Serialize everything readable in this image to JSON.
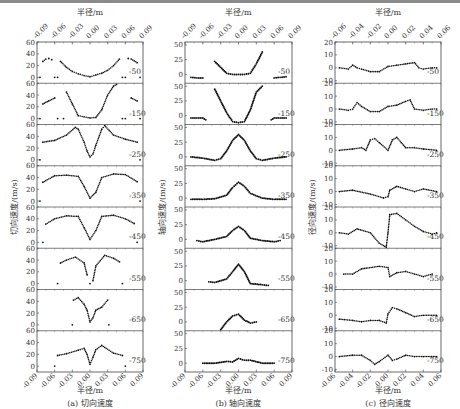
{
  "figure": {
    "x_axis_label": "半径/m",
    "levels": [
      "-50",
      "-150",
      "-250",
      "-350",
      "-450",
      "-550",
      "-650",
      "-750"
    ]
  },
  "panels": [
    {
      "id": "a",
      "caption": "(a)  切向速度",
      "ylabel": "切向速度/(m/s)",
      "xticks": [
        "-0.09",
        "-0.06",
        "-0.03",
        "0.00",
        "0.03",
        "0.06",
        "0.09"
      ],
      "yticks": [
        "0",
        "20",
        "40",
        "60"
      ]
    },
    {
      "id": "b",
      "caption": "(b)  轴向速度",
      "ylabel": "轴向速度/(m/s)",
      "xticks": [
        "-0.09",
        "-0.06",
        "-0.03",
        "0.00",
        "0.03",
        "0.06",
        "0.09"
      ],
      "yticks": [
        "0",
        "25",
        "50"
      ]
    },
    {
      "id": "c",
      "caption": "(c)  径向速度",
      "ylabel": "径向速度/(m/s)",
      "xticks": [
        "-0.06",
        "-0.04",
        "-0.02",
        "0.00",
        "0.02",
        "0.04",
        "0.06"
      ],
      "yticks": [
        "-10",
        "0",
        "10",
        "20"
      ]
    }
  ],
  "chart_data": [
    {
      "type": "scatter",
      "title": "(a) 切向速度",
      "xlabel": "半径/m",
      "ylabel": "切向速度/(m/s)",
      "xlim": [
        -0.09,
        0.09
      ],
      "ylim": [
        -10,
        60
      ],
      "xticks": [
        -0.09,
        -0.06,
        -0.03,
        0.0,
        0.03,
        0.06,
        0.09
      ],
      "yticks": [
        0,
        20,
        40,
        60
      ],
      "series": [
        {
          "name": "-50",
          "x": [
            -0.085,
            -0.08,
            -0.075,
            -0.07,
            -0.065,
            -0.06,
            -0.055,
            -0.05,
            -0.04,
            -0.03,
            -0.02,
            -0.01,
            0,
            0.01,
            0.02,
            0.03,
            0.04,
            0.05,
            0.055,
            0.06,
            0.065,
            0.07,
            0.075,
            0.08,
            0.085
          ],
          "y": [
            0,
            27,
            31,
            32,
            30,
            0,
            0,
            27,
            17,
            10,
            6,
            3,
            1,
            4,
            7,
            12,
            20,
            31,
            0,
            0,
            32,
            31,
            28,
            25,
            0
          ]
        },
        {
          "name": "-150",
          "x": [
            -0.085,
            -0.08,
            -0.07,
            -0.06,
            -0.055,
            -0.045,
            -0.04,
            -0.03,
            -0.02,
            -0.01,
            0,
            0.01,
            0.02,
            0.03,
            0.04,
            0.045,
            0.055,
            0.06,
            0.07,
            0.08,
            0.085
          ],
          "y": [
            0,
            25,
            30,
            35,
            0,
            0,
            45,
            25,
            5,
            3,
            1,
            2,
            15,
            40,
            55,
            58,
            0,
            0,
            35,
            30,
            0
          ],
          "note": "approximate"
        },
        {
          "name": "-250",
          "x": [
            -0.085,
            -0.08,
            -0.06,
            -0.04,
            -0.025,
            -0.02,
            -0.01,
            -0.005,
            0,
            0.005,
            0.01,
            0.02,
            0.025,
            0.04,
            0.06,
            0.08,
            0.085
          ],
          "y": [
            0,
            30,
            33,
            42,
            55,
            52,
            30,
            15,
            5,
            10,
            25,
            52,
            58,
            42,
            35,
            30,
            0
          ]
        },
        {
          "name": "-350",
          "x": [
            -0.085,
            -0.08,
            -0.06,
            -0.04,
            -0.02,
            -0.01,
            0,
            0.01,
            0.02,
            0.04,
            0.06,
            0.08,
            0.085
          ],
          "y": [
            0,
            32,
            43,
            44,
            42,
            25,
            5,
            15,
            40,
            46,
            45,
            33,
            0
          ]
        },
        {
          "name": "-450",
          "x": [
            -0.08,
            -0.075,
            -0.06,
            -0.04,
            -0.02,
            -0.01,
            0,
            0.01,
            0.02,
            0.04,
            0.06,
            0.075,
            0.08
          ],
          "y": [
            0,
            31,
            40,
            45,
            44,
            25,
            5,
            20,
            44,
            46,
            40,
            32,
            0
          ]
        },
        {
          "name": "-550",
          "x": [
            -0.055,
            -0.05,
            -0.04,
            -0.025,
            -0.01,
            -0.005,
            0,
            0.005,
            0.01,
            0.025,
            0.04,
            0.05,
            0.055
          ],
          "y": [
            0,
            35,
            40,
            45,
            35,
            15,
            0,
            5,
            30,
            48,
            43,
            37,
            0
          ]
        },
        {
          "name": "-650",
          "x": [
            -0.03,
            -0.028,
            -0.02,
            -0.01,
            -0.005,
            0,
            0.005,
            0.01,
            0.02,
            0.03,
            0.032
          ],
          "y": [
            0,
            42,
            46,
            35,
            25,
            5,
            12,
            25,
            30,
            42,
            0
          ]
        },
        {
          "name": "-750",
          "x": [
            -0.06,
            -0.055,
            -0.04,
            -0.02,
            -0.01,
            -0.005,
            0,
            0.005,
            0.01,
            0.02,
            0.04,
            0.055,
            0.06
          ],
          "y": [
            0,
            18,
            21,
            27,
            30,
            20,
            3,
            15,
            28,
            35,
            22,
            18,
            0
          ]
        }
      ]
    },
    {
      "type": "line",
      "title": "(b) 轴向速度",
      "xlabel": "半径/m",
      "ylabel": "轴向速度/(m/s)",
      "xlim": [
        -0.09,
        0.09
      ],
      "ylim": [
        -15,
        55
      ],
      "xticks": [
        -0.09,
        -0.06,
        -0.03,
        0.0,
        0.03,
        0.06,
        0.09
      ],
      "yticks": [
        0,
        25,
        50
      ],
      "series": [
        {
          "name": "-50",
          "x": [
            -0.08,
            -0.07,
            -0.06,
            -0.045,
            -0.04,
            -0.03,
            -0.02,
            -0.01,
            0,
            0.01,
            0.02,
            0.03,
            0.04,
            0.045,
            0.06,
            0.07,
            0.08
          ],
          "y": [
            -5,
            -6,
            -6,
            null,
            22,
            12,
            2,
            0,
            0,
            0,
            2,
            18,
            38,
            null,
            -6,
            -5,
            -4
          ]
        },
        {
          "name": "-150",
          "x": [
            -0.08,
            -0.07,
            -0.06,
            -0.055,
            -0.045,
            -0.04,
            -0.03,
            -0.02,
            -0.01,
            0,
            0.01,
            0.02,
            0.03,
            0.04,
            0.045,
            0.055,
            0.06,
            0.07,
            0.08
          ],
          "y": [
            -4,
            -4,
            -4,
            -7,
            null,
            45,
            25,
            5,
            -10,
            -12,
            -10,
            10,
            40,
            50,
            null,
            -7,
            -4,
            -4,
            -4
          ]
        },
        {
          "name": "-250",
          "x": [
            -0.08,
            -0.06,
            -0.04,
            -0.03,
            -0.02,
            -0.01,
            0,
            0.01,
            0.02,
            0.03,
            0.04,
            0.06,
            0.08
          ],
          "y": [
            0,
            -2,
            -6,
            -3,
            10,
            28,
            38,
            28,
            10,
            -3,
            -6,
            -2,
            0
          ]
        },
        {
          "name": "-350",
          "x": [
            -0.08,
            -0.06,
            -0.04,
            -0.02,
            -0.01,
            0,
            0.01,
            0.02,
            0.04,
            0.06,
            0.08
          ],
          "y": [
            -2,
            -2,
            -1,
            5,
            18,
            27,
            20,
            8,
            0,
            -2,
            -2
          ]
        },
        {
          "name": "-450",
          "x": [
            -0.07,
            -0.06,
            -0.04,
            -0.02,
            -0.01,
            0,
            0.01,
            0.02,
            0.04,
            0.06,
            0.07
          ],
          "y": [
            -2,
            -4,
            0,
            5,
            15,
            22,
            15,
            2,
            -2,
            -4,
            -2
          ]
        },
        {
          "name": "-550",
          "x": [
            -0.05,
            -0.04,
            -0.02,
            -0.01,
            0,
            0.01,
            0.02,
            0.04,
            0.05
          ],
          "y": [
            -2,
            -3,
            3,
            15,
            28,
            15,
            -5,
            -7,
            -8
          ]
        },
        {
          "name": "-650",
          "x": [
            -0.03,
            -0.02,
            -0.01,
            0,
            0.01,
            0.02,
            0.03
          ],
          "y": [
            -15,
            0,
            10,
            13,
            3,
            -2,
            0
          ]
        },
        {
          "name": "-750",
          "x": [
            -0.06,
            -0.04,
            -0.02,
            -0.01,
            0,
            0.01,
            0.02,
            0.04,
            0.06
          ],
          "y": [
            0,
            0,
            3,
            2,
            8,
            5,
            5,
            0,
            0
          ]
        }
      ]
    },
    {
      "type": "scatter",
      "title": "(c) 径向速度",
      "xlabel": "半径/m",
      "ylabel": "径向速度/(m/s)",
      "xlim": [
        -0.06,
        0.06
      ],
      "ylim": [
        -12,
        20
      ],
      "xticks": [
        -0.06,
        -0.04,
        -0.02,
        0.0,
        0.02,
        0.04,
        0.06
      ],
      "yticks": [
        -10,
        0,
        10,
        20
      ],
      "series": [
        {
          "name": "-50",
          "x": [
            -0.055,
            -0.045,
            -0.04,
            -0.035,
            -0.03,
            -0.02,
            -0.01,
            0,
            0.01,
            0.02,
            0.03,
            0.035,
            0.04,
            0.05,
            0.055
          ],
          "y": [
            0,
            -1,
            2,
            0,
            -1,
            -3,
            -3,
            1,
            2,
            3,
            4,
            0,
            -1,
            0,
            0
          ]
        },
        {
          "name": "-150",
          "x": [
            -0.055,
            -0.045,
            -0.04,
            -0.035,
            -0.03,
            -0.02,
            -0.01,
            0,
            0.01,
            0.02,
            0.025,
            0.03,
            0.04,
            0.05,
            0.055
          ],
          "y": [
            0,
            -1,
            0,
            5,
            2,
            -2,
            -2,
            2,
            3,
            6,
            7,
            0,
            -1,
            0,
            0
          ]
        },
        {
          "name": "-250",
          "x": [
            -0.055,
            -0.04,
            -0.03,
            -0.025,
            -0.02,
            -0.015,
            -0.01,
            0,
            0.005,
            0.01,
            0.015,
            0.02,
            0.03,
            0.04,
            0.055
          ],
          "y": [
            0,
            1,
            2,
            0,
            8,
            9,
            6,
            0,
            8,
            10,
            6,
            2,
            2,
            1,
            0
          ]
        },
        {
          "name": "-350",
          "x": [
            -0.055,
            -0.04,
            -0.02,
            -0.005,
            0,
            0.002,
            0.01,
            0.02,
            0.03,
            0.04,
            0.055
          ],
          "y": [
            0,
            1,
            -2,
            -5,
            -4,
            1,
            4,
            2,
            0,
            2,
            0
          ]
        },
        {
          "name": "-450",
          "x": [
            -0.055,
            -0.045,
            -0.035,
            -0.02,
            -0.01,
            -0.002,
            0,
            0.002,
            0.01,
            0.02,
            0.03,
            0.04,
            0.05,
            0.055
          ],
          "y": [
            0,
            -1,
            3,
            0,
            -8,
            -13,
            0,
            14,
            15,
            10,
            5,
            1,
            -1,
            0
          ]
        },
        {
          "name": "-550",
          "x": [
            -0.05,
            -0.04,
            -0.03,
            -0.01,
            0,
            0.002,
            0.01,
            0.02,
            0.03,
            0.04,
            0.05
          ],
          "y": [
            0,
            0,
            4,
            6,
            5,
            -2,
            1,
            2,
            0,
            -2,
            0
          ]
        },
        {
          "name": "-650",
          "x": [
            -0.055,
            -0.04,
            -0.03,
            -0.02,
            -0.01,
            -0.002,
            0,
            0.005,
            0.01,
            0.02,
            0.03,
            0.04,
            0.055
          ],
          "y": [
            -3,
            -4,
            -5,
            -4,
            -4,
            -6,
            1,
            6,
            5,
            2,
            -1,
            0,
            0
          ]
        },
        {
          "name": "-750",
          "x": [
            -0.055,
            -0.04,
            -0.03,
            -0.02,
            -0.015,
            -0.01,
            0,
            0.005,
            0.01,
            0.02,
            0.03,
            0.04,
            0.055
          ],
          "y": [
            0,
            1,
            1,
            -3,
            -6,
            -4,
            1,
            -3,
            -2,
            1,
            0,
            0,
            0
          ]
        }
      ]
    }
  ]
}
